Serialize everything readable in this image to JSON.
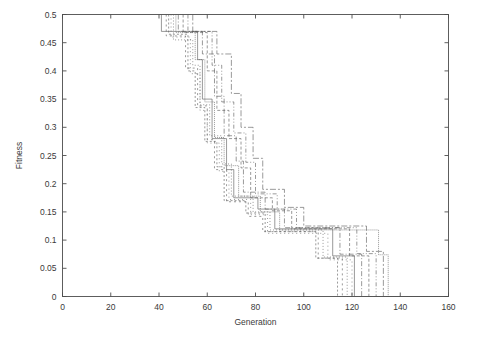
{
  "figure": {
    "width": 477,
    "height": 337,
    "background": "#ffffff",
    "axes_color": "#4d4d4d",
    "text_color": "#3a3a3a"
  },
  "chart_data": {
    "type": "line",
    "title": "",
    "subtitle": "",
    "xlabel": "Generation",
    "ylabel": "Fitness",
    "xlim": [
      0,
      160
    ],
    "ylim": [
      0,
      0.5
    ],
    "xticks": [
      0,
      20,
      40,
      60,
      80,
      100,
      120,
      140,
      160
    ],
    "xtick_labels": [
      "0",
      "20",
      "40",
      "60",
      "80",
      "100",
      "120",
      "140",
      "160"
    ],
    "yticks": [
      0,
      0.05,
      0.1,
      0.15,
      0.2,
      0.25,
      0.3,
      0.35,
      0.4,
      0.45,
      0.5
    ],
    "ytick_labels": [
      "0",
      "0.05",
      "0.1",
      "0.15",
      "0.2",
      "0.25",
      "0.3",
      "0.35",
      "0.4",
      "0.45",
      "0.5"
    ],
    "grid": false,
    "legend": null,
    "legend_position": "none",
    "box": true,
    "tick_direction": "in",
    "annotations": [],
    "line_color": "#555555",
    "line_width": 0.6,
    "series": [
      {
        "name": "run-1",
        "dash": "none",
        "points": [
          [
            41,
            0.5
          ],
          [
            41,
            0.47
          ],
          [
            56,
            0.47
          ],
          [
            56,
            0.42
          ],
          [
            58,
            0.42
          ],
          [
            58,
            0.35
          ],
          [
            62,
            0.35
          ],
          [
            62,
            0.28
          ],
          [
            68,
            0.28
          ],
          [
            68,
            0.225
          ],
          [
            71,
            0.225
          ],
          [
            71,
            0.175
          ],
          [
            81,
            0.175
          ],
          [
            81,
            0.155
          ],
          [
            88,
            0.155
          ],
          [
            88,
            0.12
          ],
          [
            112,
            0.12
          ],
          [
            112,
            0.072
          ],
          [
            121,
            0.072
          ],
          [
            121,
            0.0
          ],
          [
            160,
            0.0
          ]
        ]
      },
      {
        "name": "run-2",
        "dash": "2,2",
        "points": [
          [
            44,
            0.5
          ],
          [
            44,
            0.465
          ],
          [
            52,
            0.465
          ],
          [
            52,
            0.4
          ],
          [
            55,
            0.4
          ],
          [
            55,
            0.335
          ],
          [
            59,
            0.335
          ],
          [
            59,
            0.275
          ],
          [
            64,
            0.275
          ],
          [
            64,
            0.23
          ],
          [
            67,
            0.23
          ],
          [
            67,
            0.17
          ],
          [
            76,
            0.17
          ],
          [
            76,
            0.148
          ],
          [
            84,
            0.148
          ],
          [
            84,
            0.115
          ],
          [
            105,
            0.115
          ],
          [
            105,
            0.068
          ],
          [
            114,
            0.068
          ],
          [
            114,
            0.0
          ],
          [
            160,
            0.0
          ]
        ]
      },
      {
        "name": "run-3",
        "dash": "1,2",
        "points": [
          [
            46,
            0.5
          ],
          [
            46,
            0.455
          ],
          [
            54,
            0.455
          ],
          [
            54,
            0.41
          ],
          [
            57,
            0.41
          ],
          [
            57,
            0.34
          ],
          [
            61,
            0.34
          ],
          [
            61,
            0.285
          ],
          [
            66,
            0.285
          ],
          [
            66,
            0.235
          ],
          [
            70,
            0.235
          ],
          [
            70,
            0.178
          ],
          [
            79,
            0.178
          ],
          [
            79,
            0.15
          ],
          [
            86,
            0.15
          ],
          [
            86,
            0.118
          ],
          [
            108,
            0.118
          ],
          [
            108,
            0.07
          ],
          [
            118,
            0.07
          ],
          [
            118,
            0.0
          ],
          [
            160,
            0.0
          ]
        ]
      },
      {
        "name": "run-4",
        "dash": "5,2,1,2",
        "points": [
          [
            48,
            0.5
          ],
          [
            48,
            0.47
          ],
          [
            58,
            0.47
          ],
          [
            58,
            0.43
          ],
          [
            63,
            0.43
          ],
          [
            63,
            0.355
          ],
          [
            67,
            0.355
          ],
          [
            67,
            0.285
          ],
          [
            72,
            0.285
          ],
          [
            72,
            0.24
          ],
          [
            75,
            0.24
          ],
          [
            75,
            0.185
          ],
          [
            84,
            0.185
          ],
          [
            84,
            0.155
          ],
          [
            92,
            0.155
          ],
          [
            92,
            0.122
          ],
          [
            115,
            0.122
          ],
          [
            115,
            0.075
          ],
          [
            124,
            0.075
          ],
          [
            124,
            0.0
          ],
          [
            160,
            0.0
          ]
        ]
      },
      {
        "name": "run-5",
        "dash": "3,2",
        "points": [
          [
            50,
            0.5
          ],
          [
            50,
            0.468
          ],
          [
            60,
            0.468
          ],
          [
            60,
            0.4
          ],
          [
            64,
            0.4
          ],
          [
            64,
            0.33
          ],
          [
            69,
            0.33
          ],
          [
            69,
            0.28
          ],
          [
            74,
            0.28
          ],
          [
            74,
            0.228
          ],
          [
            78,
            0.228
          ],
          [
            78,
            0.175
          ],
          [
            87,
            0.175
          ],
          [
            87,
            0.152
          ],
          [
            95,
            0.152
          ],
          [
            95,
            0.12
          ],
          [
            119,
            0.12
          ],
          [
            119,
            0.072
          ],
          [
            127,
            0.072
          ],
          [
            127,
            0.0
          ],
          [
            160,
            0.0
          ]
        ]
      },
      {
        "name": "run-6",
        "dash": "1,3",
        "points": [
          [
            45,
            0.5
          ],
          [
            45,
            0.46
          ],
          [
            53,
            0.46
          ],
          [
            53,
            0.395
          ],
          [
            57,
            0.395
          ],
          [
            57,
            0.33
          ],
          [
            60,
            0.33
          ],
          [
            60,
            0.272
          ],
          [
            65,
            0.272
          ],
          [
            65,
            0.222
          ],
          [
            69,
            0.222
          ],
          [
            69,
            0.172
          ],
          [
            78,
            0.172
          ],
          [
            78,
            0.145
          ],
          [
            85,
            0.145
          ],
          [
            85,
            0.112
          ],
          [
            110,
            0.112
          ],
          [
            110,
            0.065
          ],
          [
            120,
            0.065
          ],
          [
            120,
            0.0
          ],
          [
            160,
            0.0
          ]
        ]
      },
      {
        "name": "run-7",
        "dash": "4,2,1,2,1,2",
        "points": [
          [
            52,
            0.5
          ],
          [
            52,
            0.47
          ],
          [
            62,
            0.47
          ],
          [
            62,
            0.41
          ],
          [
            66,
            0.41
          ],
          [
            66,
            0.345
          ],
          [
            71,
            0.345
          ],
          [
            71,
            0.29
          ],
          [
            76,
            0.29
          ],
          [
            76,
            0.238
          ],
          [
            80,
            0.238
          ],
          [
            80,
            0.182
          ],
          [
            89,
            0.182
          ],
          [
            89,
            0.155
          ],
          [
            97,
            0.155
          ],
          [
            97,
            0.122
          ],
          [
            122,
            0.122
          ],
          [
            122,
            0.076
          ],
          [
            130,
            0.076
          ],
          [
            130,
            0.0
          ],
          [
            160,
            0.0
          ]
        ]
      },
      {
        "name": "run-8",
        "dash": "2,3",
        "points": [
          [
            43,
            0.5
          ],
          [
            43,
            0.462
          ],
          [
            51,
            0.462
          ],
          [
            51,
            0.405
          ],
          [
            56,
            0.405
          ],
          [
            56,
            0.338
          ],
          [
            60,
            0.338
          ],
          [
            60,
            0.278
          ],
          [
            63,
            0.278
          ],
          [
            63,
            0.225
          ],
          [
            68,
            0.225
          ],
          [
            68,
            0.168
          ],
          [
            77,
            0.168
          ],
          [
            77,
            0.142
          ],
          [
            83,
            0.142
          ],
          [
            83,
            0.115
          ],
          [
            106,
            0.115
          ],
          [
            106,
            0.068
          ],
          [
            116,
            0.068
          ],
          [
            116,
            0.0
          ],
          [
            160,
            0.0
          ]
        ]
      },
      {
        "name": "run-9",
        "dash": "6,2,2,2",
        "points": [
          [
            54,
            0.5
          ],
          [
            54,
            0.47
          ],
          [
            64,
            0.47
          ],
          [
            64,
            0.43
          ],
          [
            70,
            0.43
          ],
          [
            70,
            0.36
          ],
          [
            74,
            0.36
          ],
          [
            74,
            0.3
          ],
          [
            79,
            0.3
          ],
          [
            79,
            0.245
          ],
          [
            83,
            0.245
          ],
          [
            83,
            0.19
          ],
          [
            92,
            0.19
          ],
          [
            92,
            0.158
          ],
          [
            100,
            0.158
          ],
          [
            100,
            0.125
          ],
          [
            126,
            0.125
          ],
          [
            126,
            0.08
          ],
          [
            133,
            0.08
          ],
          [
            133,
            0.0
          ],
          [
            160,
            0.0
          ]
        ]
      },
      {
        "name": "run-10",
        "dash": "1,1",
        "points": [
          [
            47,
            0.5
          ],
          [
            47,
            0.468
          ],
          [
            55,
            0.468
          ],
          [
            55,
            0.42
          ],
          [
            59,
            0.42
          ],
          [
            59,
            0.345
          ],
          [
            63,
            0.345
          ],
          [
            63,
            0.282
          ],
          [
            67,
            0.282
          ],
          [
            67,
            0.232
          ],
          [
            73,
            0.232
          ],
          [
            73,
            0.178
          ],
          [
            82,
            0.178
          ],
          [
            82,
            0.15
          ],
          [
            90,
            0.15
          ],
          [
            90,
            0.118
          ],
          [
            131,
            0.118
          ],
          [
            131,
            0.074
          ],
          [
            135,
            0.074
          ],
          [
            135,
            0.0
          ],
          [
            160,
            0.0
          ]
        ]
      }
    ]
  }
}
